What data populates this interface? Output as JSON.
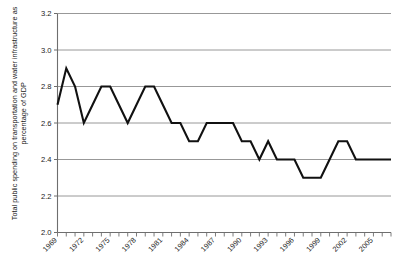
{
  "chart_data": {
    "type": "line",
    "title": "",
    "subtitle": "",
    "xlabel": "",
    "ylabel": "Total public spending on transportation and water infrastructure as percentage of GDP",
    "ylim": [
      2.0,
      3.2
    ],
    "ytick_step": 0.2,
    "ytick_labels": [
      "3.2",
      "3.0",
      "2.8",
      "2.6",
      "2.4",
      "2.2",
      "2.0"
    ],
    "ytick_values": [
      3.2,
      3.0,
      2.8,
      2.6,
      2.4,
      2.2,
      2.0
    ],
    "xlim": [
      1969,
      2007
    ],
    "xtick_labels": [
      "1969",
      "1972",
      "1975",
      "1978",
      "1981",
      "1984",
      "1987",
      "1990",
      "1993",
      "1996",
      "1999",
      "2002",
      "2005"
    ],
    "xtick_values": [
      1969,
      1972,
      1975,
      1978,
      1981,
      1984,
      1987,
      1990,
      1993,
      1996,
      1999,
      2002,
      2005
    ],
    "xtick_minor_step": 1,
    "grid": "horizontal",
    "legend": "none",
    "series": [
      {
        "name": "Total public spending on transportation and water infrastructure as percentage of GDP",
        "color": "#111111",
        "x": [
          1969,
          1970,
          1971,
          1972,
          1973,
          1974,
          1975,
          1976,
          1977,
          1978,
          1979,
          1980,
          1981,
          1982,
          1983,
          1984,
          1985,
          1986,
          1987,
          1988,
          1989,
          1990,
          1991,
          1992,
          1993,
          1994,
          1995,
          1996,
          1997,
          1998,
          1999,
          2000,
          2001,
          2002,
          2003,
          2004,
          2005,
          2006,
          2007
        ],
        "values": [
          2.7,
          2.9,
          2.8,
          2.6,
          2.7,
          2.8,
          2.8,
          2.7,
          2.6,
          2.7,
          2.8,
          2.8,
          2.7,
          2.6,
          2.6,
          2.5,
          2.5,
          2.6,
          2.6,
          2.6,
          2.6,
          2.5,
          2.5,
          2.4,
          2.5,
          2.4,
          2.4,
          2.4,
          2.3,
          2.3,
          2.3,
          2.4,
          2.5,
          2.5,
          2.4,
          2.4,
          2.4,
          2.4,
          2.4
        ]
      }
    ],
    "colors": {
      "line": "#111111",
      "grid": "#8c8c8c",
      "axis": "#6e6e6e",
      "text": "#1a1a1a",
      "background": "#ffffff"
    }
  }
}
